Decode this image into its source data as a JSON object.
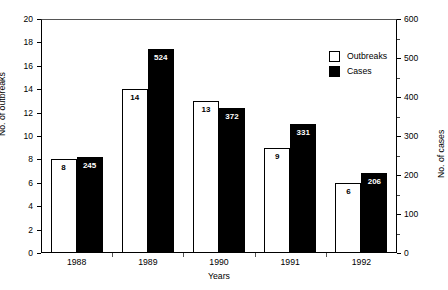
{
  "chart_data": {
    "type": "bar",
    "title": "",
    "subtitle": "",
    "xlabel": "Years",
    "categories": [
      "1988",
      "1989",
      "1990",
      "1991",
      "1992"
    ],
    "series": [
      {
        "name": "Outbreaks",
        "axis": "left",
        "color": "#ffffff",
        "edge_color": "#000000",
        "values": [
          8,
          14,
          13,
          9,
          6
        ],
        "labels": [
          "8",
          "14",
          "13",
          "9",
          "6"
        ]
      },
      {
        "name": "Cases",
        "axis": "right",
        "color": "#000000",
        "edge_color": "#000000",
        "values": [
          245,
          524,
          372,
          331,
          206
        ],
        "labels": [
          "245",
          "524",
          "372",
          "331",
          "206"
        ]
      }
    ],
    "axes": {
      "left": {
        "label": "No. of outbreaks",
        "min": 0,
        "max": 20,
        "ticks": [
          0,
          2,
          4,
          6,
          8,
          10,
          12,
          14,
          16,
          18,
          20
        ],
        "tick_labels": [
          "0",
          "2",
          "4",
          "6",
          "8",
          "10",
          "12",
          "14",
          "16",
          "18",
          "20"
        ]
      },
      "right": {
        "label": "No. of cases",
        "min": 0,
        "max": 600,
        "ticks": [
          0,
          100,
          200,
          300,
          400,
          500,
          600
        ],
        "tick_labels": [
          "0",
          "100",
          "200",
          "300",
          "400",
          "500",
          "600"
        ],
        "minor_ticks": [
          50,
          150,
          250,
          350,
          450,
          550
        ]
      },
      "x": {
        "label": "Years",
        "tick_labels": [
          "1988",
          "1989",
          "1990",
          "1991",
          "1992"
        ]
      }
    },
    "grid": false,
    "legend": {
      "position": "upper-right-inside",
      "entries": [
        {
          "label": "Outbreaks",
          "swatch": "outline"
        },
        {
          "label": "Cases",
          "swatch": "filled"
        }
      ]
    }
  }
}
